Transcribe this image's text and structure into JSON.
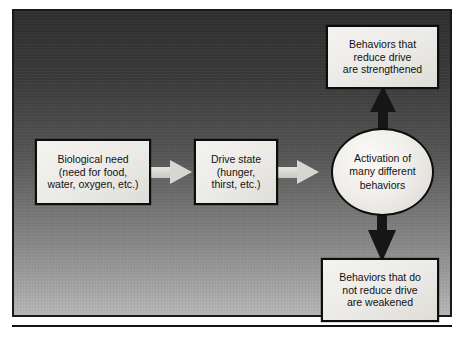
{
  "diagram": {
    "type": "flow",
    "colors": {
      "frame_border": "#1a1a1a",
      "background_top": "#2e2e2e",
      "background_bottom": "#b6b6b6",
      "node_fill": "#f1efeb",
      "node_border": "#0d0d0d",
      "light_arrow": "#d8d6d0",
      "dark_arrow": "#161616",
      "text": "#111111"
    },
    "nodes": [
      {
        "id": "biological-need",
        "shape": "rect",
        "lines": [
          "Biological need",
          "(need for food,",
          "water, oxygen, etc.)"
        ]
      },
      {
        "id": "drive-state",
        "shape": "rect",
        "lines": [
          "Drive state",
          "(hunger,",
          "thirst, etc.)"
        ]
      },
      {
        "id": "activation",
        "shape": "ellipse",
        "lines": [
          "Activation of",
          "many different",
          "behaviors"
        ]
      },
      {
        "id": "behaviors-strengthened",
        "shape": "rect",
        "lines": [
          "Behaviors that",
          "reduce drive",
          "are strengthened"
        ]
      },
      {
        "id": "behaviors-weakened",
        "shape": "rect",
        "lines": [
          "Behaviors that do",
          "not reduce drive",
          "are weakened"
        ]
      }
    ],
    "edges": [
      {
        "id": "need-to-drive",
        "from": "biological-need",
        "to": "drive-state",
        "style": "light",
        "direction": "right"
      },
      {
        "id": "drive-to-activation",
        "from": "drive-state",
        "to": "activation",
        "style": "light",
        "direction": "right"
      },
      {
        "id": "activation-to-strengthened",
        "from": "activation",
        "to": "behaviors-strengthened",
        "style": "dark",
        "direction": "up"
      },
      {
        "id": "activation-to-weakened",
        "from": "activation",
        "to": "behaviors-weakened",
        "style": "dark",
        "direction": "down"
      }
    ]
  }
}
